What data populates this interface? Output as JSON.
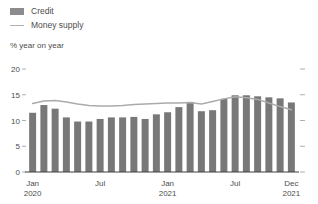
{
  "legend": {
    "items": [
      {
        "label": "Credit",
        "mark": "bar-swatch-icon",
        "color": "#787878"
      },
      {
        "label": "Money supply",
        "mark": "line-swatch-icon",
        "color": "#ababab"
      }
    ]
  },
  "axis_title": "% year on year",
  "chart_data": {
    "type": "bar",
    "title": "",
    "subtitle": "",
    "xlabel": "",
    "ylabel": "% year on year",
    "ylim": [
      0,
      20
    ],
    "yticks": [
      0,
      5,
      10,
      15,
      20
    ],
    "grid": false,
    "legend_position": "top-left",
    "categories": [
      "Jan 2020",
      "Feb 2020",
      "Mar 2020",
      "Apr 2020",
      "May 2020",
      "Jun 2020",
      "Jul 2020",
      "Aug 2020",
      "Sep 2020",
      "Oct 2020",
      "Nov 2020",
      "Dec 2020",
      "Jan 2021",
      "Feb 2021",
      "Mar 2021",
      "Apr 2021",
      "May 2021",
      "Jun 2021",
      "Jul 2021",
      "Aug 2021",
      "Sep 2021",
      "Oct 2021",
      "Nov 2021",
      "Dec 2021"
    ],
    "xtick_labels": [
      {
        "index": 0,
        "line1": "Jan",
        "line2": "2020"
      },
      {
        "index": 6,
        "line1": "Jul",
        "line2": ""
      },
      {
        "index": 12,
        "line1": "Jan",
        "line2": "2021"
      },
      {
        "index": 18,
        "line1": "Jul",
        "line2": ""
      },
      {
        "index": 23,
        "line1": "Dec",
        "line2": "2021"
      }
    ],
    "series": [
      {
        "name": "Credit",
        "type": "bar",
        "color": "#787878",
        "values": [
          11.5,
          13.0,
          12.3,
          10.6,
          9.8,
          9.8,
          10.3,
          10.6,
          10.6,
          10.7,
          10.3,
          11.2,
          11.6,
          12.6,
          13.6,
          11.8,
          12.0,
          14.2,
          14.9,
          14.9,
          14.7,
          14.5,
          14.3,
          13.5
        ]
      },
      {
        "name": "Money supply",
        "type": "line",
        "color": "#ababab",
        "values": [
          13.3,
          13.8,
          13.9,
          13.6,
          13.2,
          12.9,
          12.8,
          12.8,
          12.9,
          13.1,
          13.2,
          13.3,
          13.4,
          13.4,
          13.5,
          13.2,
          13.7,
          14.2,
          14.6,
          14.4,
          14.1,
          13.4,
          12.7,
          12.1
        ]
      }
    ]
  }
}
